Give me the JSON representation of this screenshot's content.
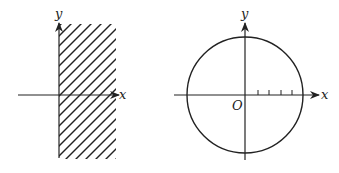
{
  "figures": [
    {
      "name": "half-plane",
      "axis_labels": {
        "x": "x",
        "y": "y"
      },
      "description": "Shaded region x >= 0 (right half-plane strip)"
    },
    {
      "name": "circle",
      "axis_labels": {
        "x": "x",
        "y": "y",
        "origin": "O"
      },
      "tick_count": 4
    }
  ],
  "colors": {
    "stroke": "#222222",
    "background": "#ffffff"
  }
}
